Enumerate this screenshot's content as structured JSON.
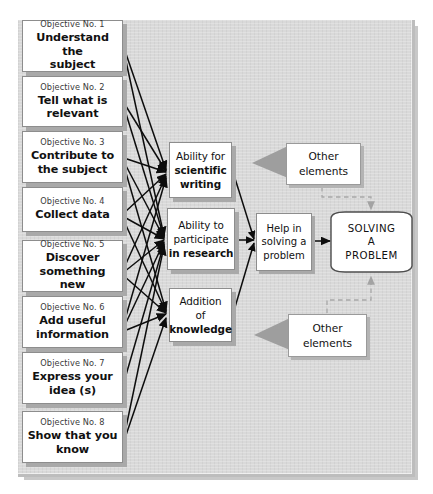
{
  "diagram": {
    "colors": {
      "panel_bg": "#d9d9d9",
      "node_bg": "#ffffff",
      "node_border": "#8d8d8d",
      "node_shadow": "#a9a9a9",
      "connector": "#101010",
      "dashed_connector": "#a0a0a0",
      "callout_triangle": "#9e9e9e",
      "text": "#111111",
      "label_text": "#3a3a3a"
    },
    "objectives": [
      {
        "no": "Objective No. 1",
        "text": "Understand the\nsubject"
      },
      {
        "no": "Objective No. 2",
        "text": "Tell what is\nrelevant"
      },
      {
        "no": "Objective No. 3",
        "text": "Contribute to\nthe subject"
      },
      {
        "no": "Objective No. 4",
        "text": "Collect data"
      },
      {
        "no": "Objective No. 5",
        "text": "Discover\nsomething new"
      },
      {
        "no": "Objective No. 6",
        "text": "Add useful\ninformation"
      },
      {
        "no": "Objective No. 7",
        "text": "Express your\nidea (s)"
      },
      {
        "no": "Objective No. 8",
        "text": "Show that you\nknow"
      }
    ],
    "abilities": [
      {
        "id": "scientific-writing",
        "line1": "Ability for",
        "line2": "scientific",
        "line3": "writing"
      },
      {
        "id": "participate-research",
        "line1": "Ability to",
        "line2": "participate",
        "line3": "in research"
      },
      {
        "id": "addition-knowledge",
        "line1": "Addition",
        "line2": "of",
        "line3": "knowledge"
      }
    ],
    "help": {
      "line1": "Help in",
      "line2": "solving a",
      "line3": "problem"
    },
    "goal": {
      "line1": "SOLVING",
      "line2": "A",
      "line3": "PROBLEM"
    },
    "other_elements_top": {
      "line1": "Other",
      "line2": "elements"
    },
    "other_elements_bottom": {
      "line1": "Other",
      "line2": "elements"
    },
    "edges": {
      "objective_to_ability_count": 19,
      "ability_to_help_count": 3,
      "help_to_goal_count": 1,
      "other_to_goal_dashed_count": 2
    }
  }
}
